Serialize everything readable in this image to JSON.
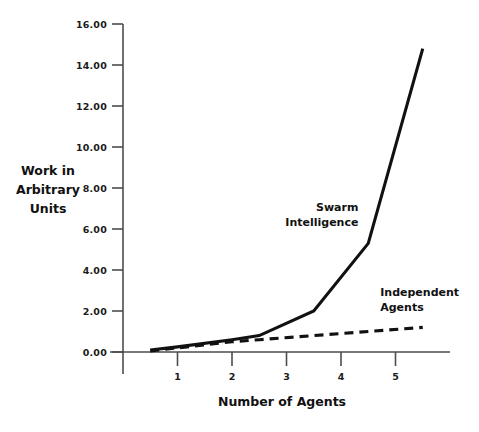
{
  "chart_data": {
    "type": "line",
    "title": "",
    "xlabel": "Number of Agents",
    "ylabel": "Work in Arbitrary Units",
    "ylabel_lines": [
      "Work in",
      "Arbitrary",
      "Units"
    ],
    "xlim": [
      0,
      6
    ],
    "ylim": [
      0,
      16
    ],
    "grid": false,
    "legend_position": "inline-annotations",
    "xticks": [
      1,
      2,
      3,
      4,
      5
    ],
    "xtick_labels": [
      "1",
      "2",
      "3",
      "4",
      "5"
    ],
    "yticks": [
      0,
      2,
      4,
      6,
      8,
      10,
      12,
      14,
      16
    ],
    "ytick_labels": [
      "0.00",
      "2.00",
      "4.00",
      "6.00",
      "8.00",
      "10.00",
      "12.00",
      "14.00",
      "16.00"
    ],
    "series": [
      {
        "name": "Swarm Intelligence",
        "style": "solid",
        "color": "#111111",
        "x": [
          0.5,
          1.0,
          2.0,
          2.5,
          3.5,
          4.5,
          5.5
        ],
        "values": [
          0.1,
          0.25,
          0.6,
          0.8,
          2.0,
          5.3,
          14.8
        ]
      },
      {
        "name": "Independent Agents",
        "style": "dashed",
        "color": "#111111",
        "x": [
          0.5,
          1.0,
          2.0,
          2.5,
          3.5,
          4.5,
          5.5
        ],
        "values": [
          0.05,
          0.2,
          0.5,
          0.6,
          0.8,
          1.0,
          1.2
        ]
      }
    ],
    "annotations": [
      {
        "id": "swarm-annotation",
        "lines": [
          "Swarm",
          "Intelligence"
        ],
        "anchor": "end",
        "x": 4.32,
        "y": 6.9
      },
      {
        "id": "independent-annotation",
        "lines": [
          "Independent",
          "Agents"
        ],
        "anchor": "start",
        "x": 4.72,
        "y": 2.75
      }
    ]
  },
  "axes": {
    "x_axis_title": "Number of Agents",
    "y_axis_title_lines": [
      "Work in",
      "Arbitrary",
      "Units"
    ]
  },
  "colors": {
    "line": "#111111",
    "axis": "#4d4d4d",
    "background": "#ffffff",
    "text": "#1a1a1a"
  }
}
